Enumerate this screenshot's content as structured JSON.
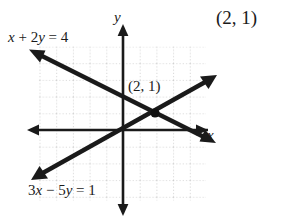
{
  "figure": {
    "type": "coordinate-graph",
    "axes": {
      "x_label": "x",
      "y_label": "y",
      "origin_px": [
        123,
        130
      ],
      "unit_px": 16.7,
      "x_range": [
        -5,
        5
      ],
      "y_range": [
        -4,
        5
      ],
      "grid": "dotted",
      "grid_color": "#b9b9b9",
      "axis_color": "#1a1a1a"
    },
    "lines": [
      {
        "name": "line-1",
        "equation": "3x − 5y = 1",
        "label": "3x − 5y = 1",
        "slope": 0.6,
        "intercept": -0.2,
        "direction": "ascending",
        "arrow_start_px": [
          35,
          178
        ],
        "arrow_end_px": [
          213,
          76
        ]
      },
      {
        "name": "line-2",
        "equation": "x + 2y = 4",
        "label": "x + 2y = 4",
        "slope": -0.5,
        "intercept": 2,
        "direction": "descending",
        "arrow_start_px": [
          33,
          52
        ],
        "arrow_end_px": [
          212,
          137
        ]
      }
    ],
    "intersection": {
      "label": "(2, 1)",
      "x": 2,
      "y": 1,
      "point_px": [
        155,
        113
      ],
      "marker": "filled-dot"
    },
    "answer": {
      "label": "(2, 1)"
    },
    "colors": {
      "ink": "#1a1a1a",
      "grid": "#b9b9b9",
      "background": "#ffffff"
    }
  }
}
